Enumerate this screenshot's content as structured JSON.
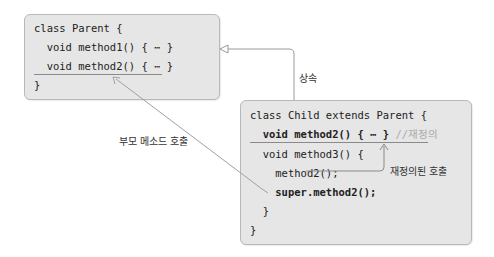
{
  "parent_class": {
    "lines": [
      "class Parent {",
      "  void method1() { ⋯ }",
      "  void method2() { ⋯ }",
      "}"
    ]
  },
  "child_class": {
    "line0": "class Child extends Parent {",
    "line1": "  void method2() { ⋯ }",
    "line1_comment": " //재정의",
    "line2": "  void method3() {",
    "line3": "    method2();",
    "line4": "    super.method2();",
    "line5": "  }",
    "line6": "}"
  },
  "labels": {
    "inheritance": "상속",
    "parent_method_call": "부모 메소드 호출",
    "overridden_call": "재정의된 호출"
  },
  "colors": {
    "box_fill": "#e6e6e6",
    "box_border": "#b9b9b9",
    "arrow": "#9a9a9a",
    "comment": "#aaaaaa"
  }
}
